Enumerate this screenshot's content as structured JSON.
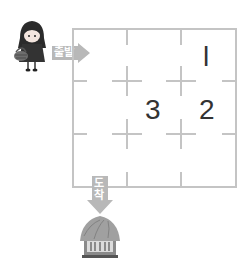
{
  "puzzle": {
    "start_label": "출발",
    "end_label_top": "도",
    "end_label_bottom": "착",
    "hut_sign": "민박",
    "grid": {
      "rows": 3,
      "cols": 3,
      "cells": [
        [
          "",
          "",
          "1"
        ],
        [
          "",
          "3",
          "2"
        ],
        [
          "",
          "",
          ""
        ]
      ]
    },
    "numbers": [
      {
        "row": 0,
        "col": 2,
        "value": "l"
      },
      {
        "row": 1,
        "col": 1,
        "value": "3"
      },
      {
        "row": 1,
        "col": 2,
        "value": "2"
      }
    ]
  },
  "colors": {
    "grid_line": "#c4c4c4",
    "arrow": "#b8b8b8",
    "number": "#333333"
  }
}
